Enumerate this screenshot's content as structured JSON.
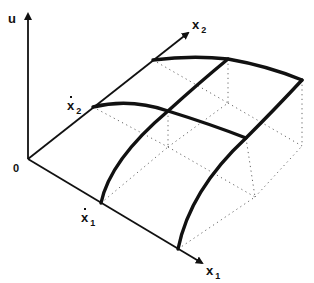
{
  "diagram": {
    "title": "",
    "axes": {
      "vertical": {
        "label": "u"
      },
      "x1": {
        "label": "x",
        "subscript": "1"
      },
      "x2": {
        "label": "x",
        "subscript": "2"
      },
      "origin": {
        "label": "0"
      }
    },
    "marks": {
      "x1_bar": {
        "label": "x",
        "subscript": "1",
        "accent": "bar"
      },
      "x2_bar": {
        "label": "x",
        "subscript": "2",
        "accent": "bar"
      }
    },
    "colors": {
      "ink": "#111111",
      "dotted": "#666666",
      "background": "#ffffff"
    }
  }
}
